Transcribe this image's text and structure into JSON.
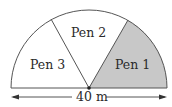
{
  "diagram": {
    "type": "semicircle-divided-pens",
    "pens": [
      {
        "label": "Pen 1",
        "shaded": true
      },
      {
        "label": "Pen 2",
        "shaded": false
      },
      {
        "label": "Pen 3",
        "shaded": false
      }
    ],
    "dimension": {
      "label": "40 m"
    },
    "colors": {
      "stroke": "#555555",
      "shade": "#c8c8c8",
      "background": "#ffffff",
      "text": "#2a2a2a"
    }
  }
}
